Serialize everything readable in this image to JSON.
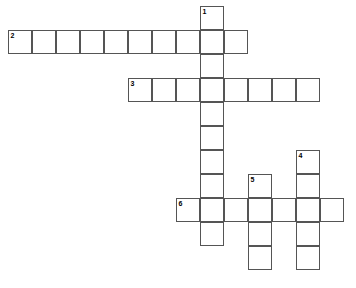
{
  "puzzle": {
    "title": "Crossword Puzzle Grid",
    "cell_size": 24,
    "origin_x": 8,
    "origin_y": 6,
    "border_color": "#555555",
    "cell_fill": "#ffffff",
    "background": "#ffffff",
    "number_color": "#000000",
    "entries": [
      {
        "number": "1",
        "direction": "down",
        "col": 8,
        "row": 0,
        "length": 10,
        "label": "1-down"
      },
      {
        "number": "2",
        "direction": "across",
        "col": 0,
        "row": 1,
        "length": 10,
        "label": "2-across"
      },
      {
        "number": "3",
        "direction": "across",
        "col": 5,
        "row": 3,
        "length": 8,
        "label": "3-across"
      },
      {
        "number": "4",
        "direction": "down",
        "col": 12,
        "row": 6,
        "length": 5,
        "label": "4-down"
      },
      {
        "number": "5",
        "direction": "down",
        "col": 10,
        "row": 7,
        "length": 4,
        "label": "5-down"
      },
      {
        "number": "6",
        "direction": "across",
        "col": 7,
        "row": 8,
        "length": 7,
        "label": "6-across"
      }
    ],
    "numbered_cells": [
      {
        "number": "1",
        "col": 8,
        "row": 0
      },
      {
        "number": "2",
        "col": 0,
        "row": 1
      },
      {
        "number": "3",
        "col": 5,
        "row": 3
      },
      {
        "number": "4",
        "col": 12,
        "row": 6
      },
      {
        "number": "5",
        "col": 10,
        "row": 7
      },
      {
        "number": "6",
        "col": 7,
        "row": 8
      }
    ]
  }
}
